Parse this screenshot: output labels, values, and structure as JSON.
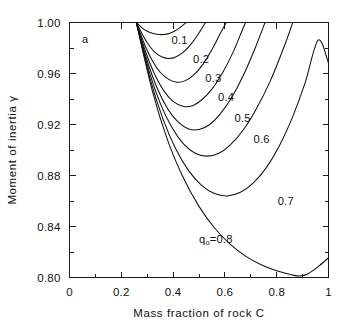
{
  "chart_data": {
    "type": "line",
    "title": "",
    "panel_label": "a",
    "xlabel": "Mass  fraction  of  rock    C",
    "ylabel": "Moment of inertia  γ",
    "xlim": [
      0,
      1
    ],
    "ylim": [
      0.8,
      1.0
    ],
    "grid": false,
    "legend": "inline-curve-labels",
    "x_ticks_major": [
      0,
      0.2,
      0.4,
      0.6,
      0.8,
      1
    ],
    "x_ticklabels": [
      "0",
      "0.2",
      "0.4",
      "0.6",
      "0.8",
      "1"
    ],
    "x_ticks_minor": [
      0.1,
      0.3,
      0.5,
      0.7,
      0.9
    ],
    "y_ticks_major": [
      0.8,
      0.84,
      0.88,
      0.92,
      0.96,
      1.0
    ],
    "y_ticklabels": [
      "0.80",
      "0.84",
      "0.88",
      "0.92",
      "0.96",
      "1.00"
    ],
    "y_ticks_minor": [
      0.82,
      0.86,
      0.9,
      0.94,
      0.98
    ],
    "series_param_name": "q₀",
    "series": [
      {
        "name": "0.1",
        "label": "0.1",
        "label_x": 0.425,
        "label_y": 0.9835,
        "points": [
          [
            0.258,
            1.0
          ],
          [
            0.28,
            0.9958
          ],
          [
            0.3,
            0.9932
          ],
          [
            0.32,
            0.9915
          ],
          [
            0.345,
            0.9906
          ],
          [
            0.365,
            0.9906
          ],
          [
            0.385,
            0.9914
          ],
          [
            0.405,
            0.9932
          ],
          [
            0.425,
            0.9958
          ],
          [
            0.442,
            0.9985
          ],
          [
            0.45,
            1.0
          ]
        ]
      },
      {
        "name": "0.2",
        "label": "0.2",
        "label_x": 0.508,
        "label_y": 0.9682,
        "points": [
          [
            0.258,
            1.0
          ],
          [
            0.285,
            0.9892
          ],
          [
            0.31,
            0.9812
          ],
          [
            0.335,
            0.9758
          ],
          [
            0.36,
            0.9727
          ],
          [
            0.385,
            0.9718
          ],
          [
            0.41,
            0.973
          ],
          [
            0.44,
            0.9768
          ],
          [
            0.47,
            0.9832
          ],
          [
            0.5,
            0.9918
          ],
          [
            0.525,
            1.0
          ]
        ]
      },
      {
        "name": "0.3",
        "label": "0.3",
        "label_x": 0.555,
        "label_y": 0.9535,
        "points": [
          [
            0.258,
            1.0
          ],
          [
            0.29,
            0.9828
          ],
          [
            0.32,
            0.97
          ],
          [
            0.35,
            0.961
          ],
          [
            0.385,
            0.9552
          ],
          [
            0.415,
            0.9532
          ],
          [
            0.445,
            0.9542
          ],
          [
            0.48,
            0.959
          ],
          [
            0.515,
            0.9672
          ],
          [
            0.55,
            0.9788
          ],
          [
            0.58,
            0.9905
          ],
          [
            0.605,
            1.0
          ]
        ]
      },
      {
        "name": "0.4",
        "label": "0.4",
        "label_x": 0.605,
        "label_y": 0.9382,
        "points": [
          [
            0.258,
            1.0
          ],
          [
            0.295,
            0.9765
          ],
          [
            0.33,
            0.9588
          ],
          [
            0.365,
            0.9462
          ],
          [
            0.4,
            0.9382
          ],
          [
            0.44,
            0.9342
          ],
          [
            0.475,
            0.9348
          ],
          [
            0.51,
            0.9392
          ],
          [
            0.55,
            0.9478
          ],
          [
            0.59,
            0.9602
          ],
          [
            0.63,
            0.976
          ],
          [
            0.665,
            0.993
          ],
          [
            0.68,
            1.0
          ]
        ]
      },
      {
        "name": "0.5",
        "label": "0.5",
        "label_x": 0.668,
        "label_y": 0.9222,
        "points": [
          [
            0.258,
            1.0
          ],
          [
            0.3,
            0.97
          ],
          [
            0.34,
            0.9478
          ],
          [
            0.38,
            0.932
          ],
          [
            0.42,
            0.9218
          ],
          [
            0.46,
            0.9165
          ],
          [
            0.5,
            0.916
          ],
          [
            0.54,
            0.9198
          ],
          [
            0.58,
            0.9278
          ],
          [
            0.625,
            0.9408
          ],
          [
            0.67,
            0.958
          ],
          [
            0.715,
            0.979
          ],
          [
            0.755,
            1.0
          ]
        ]
      },
      {
        "name": "0.6",
        "label": "0.6",
        "label_x": 0.742,
        "label_y": 0.9055,
        "points": [
          [
            0.258,
            1.0
          ],
          [
            0.305,
            0.9635
          ],
          [
            0.35,
            0.9368
          ],
          [
            0.395,
            0.9178
          ],
          [
            0.44,
            0.9048
          ],
          [
            0.485,
            0.8975
          ],
          [
            0.53,
            0.8952
          ],
          [
            0.575,
            0.8972
          ],
          [
            0.62,
            0.9038
          ],
          [
            0.67,
            0.9155
          ],
          [
            0.72,
            0.9318
          ],
          [
            0.775,
            0.954
          ],
          [
            0.83,
            0.9818
          ],
          [
            0.862,
            1.0
          ]
        ]
      },
      {
        "name": "0.7",
        "label": "0.7",
        "label_x": 0.835,
        "label_y": 0.8572,
        "points": [
          [
            0.258,
            1.0
          ],
          [
            0.31,
            0.9565
          ],
          [
            0.36,
            0.9248
          ],
          [
            0.41,
            0.901
          ],
          [
            0.46,
            0.8838
          ],
          [
            0.51,
            0.8722
          ],
          [
            0.56,
            0.8658
          ],
          [
            0.61,
            0.864
          ],
          [
            0.66,
            0.8668
          ],
          [
            0.71,
            0.8742
          ],
          [
            0.76,
            0.8862
          ],
          [
            0.81,
            0.9032
          ],
          [
            0.86,
            0.9252
          ],
          [
            0.91,
            0.9528
          ],
          [
            0.96,
            0.9862
          ],
          [
            1.0,
            0.9682
          ]
        ]
      },
      {
        "name": "0.8",
        "label": "q₀=0.8",
        "label_x": 0.565,
        "label_y": 0.827,
        "points": [
          [
            0.258,
            1.0
          ],
          [
            0.32,
            0.9462
          ],
          [
            0.38,
            0.907
          ],
          [
            0.44,
            0.878
          ],
          [
            0.5,
            0.8558
          ],
          [
            0.56,
            0.8388
          ],
          [
            0.62,
            0.8262
          ],
          [
            0.68,
            0.8168
          ],
          [
            0.74,
            0.81
          ],
          [
            0.8,
            0.8052
          ],
          [
            0.86,
            0.802
          ],
          [
            0.89,
            0.8012
          ],
          [
            0.92,
            0.8028
          ],
          [
            0.96,
            0.8085
          ],
          [
            1.0,
            0.8155
          ]
        ]
      }
    ]
  }
}
